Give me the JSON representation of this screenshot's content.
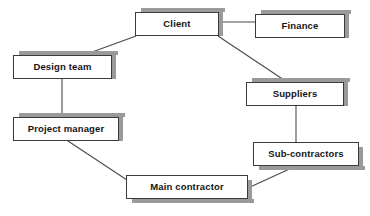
{
  "diagram": {
    "type": "organizational-relationship-diagram",
    "canvas": {
      "width": 370,
      "height": 216
    },
    "style": {
      "box_fill": "#ffffff",
      "box_border": "#3a3a3a",
      "box_shadow": "#9a9a9a",
      "edge_color": "#4a4a4a",
      "text_color": "#141414",
      "background": "#ffffff"
    },
    "nodes": [
      {
        "id": "client",
        "label": "Client",
        "x": 135,
        "y": 12,
        "w": 84,
        "h": 24,
        "shadow": "top-right"
      },
      {
        "id": "finance",
        "label": "Finance",
        "x": 255,
        "y": 14,
        "w": 90,
        "h": 24,
        "shadow": "top-right"
      },
      {
        "id": "design_team",
        "label": "Design team",
        "x": 13,
        "y": 55,
        "w": 99,
        "h": 24,
        "shadow": "top-right"
      },
      {
        "id": "suppliers",
        "label": "Suppliers",
        "x": 246,
        "y": 82,
        "w": 98,
        "h": 24,
        "shadow": "top-right"
      },
      {
        "id": "project_manager",
        "label": "Project manager",
        "x": 13,
        "y": 117,
        "w": 106,
        "h": 24,
        "shadow": "top-right"
      },
      {
        "id": "sub_contractors",
        "label": "Sub-contractors",
        "x": 253,
        "y": 142,
        "w": 106,
        "h": 24,
        "shadow": "bottom-right"
      },
      {
        "id": "main_contractor",
        "label": "Main contractor",
        "x": 126,
        "y": 175,
        "w": 122,
        "h": 24,
        "shadow": "bottom-right"
      }
    ],
    "edges": [
      {
        "id": "client-finance",
        "from": "client",
        "to": "finance",
        "x1": 219,
        "y1": 22,
        "x2": 255,
        "y2": 22,
        "kind": "horizontal"
      },
      {
        "id": "client-design_team",
        "from": "client",
        "to": "design_team",
        "x1": 136,
        "y1": 36,
        "x2": 84,
        "y2": 55,
        "kind": "diagonal"
      },
      {
        "id": "client-suppliers",
        "from": "client",
        "to": "suppliers",
        "x1": 218,
        "y1": 36,
        "x2": 287,
        "y2": 82,
        "kind": "diagonal"
      },
      {
        "id": "design_team-project_manager",
        "from": "design_team",
        "to": "project_manager",
        "x1": 62,
        "y1": 79,
        "x2": 62,
        "y2": 117,
        "kind": "vertical"
      },
      {
        "id": "suppliers-sub_contractors",
        "from": "suppliers",
        "to": "sub_contractors",
        "x1": 296,
        "y1": 106,
        "x2": 296,
        "y2": 142,
        "kind": "vertical"
      },
      {
        "id": "project_manager-main_contractor",
        "from": "project_manager",
        "to": "main_contractor",
        "x1": 68,
        "y1": 141,
        "x2": 127,
        "y2": 180,
        "kind": "diagonal"
      },
      {
        "id": "sub_contractors-main_contractor",
        "from": "sub_contractors",
        "to": "main_contractor",
        "x1": 296,
        "y1": 166,
        "x2": 248,
        "y2": 188,
        "kind": "diagonal"
      }
    ]
  }
}
